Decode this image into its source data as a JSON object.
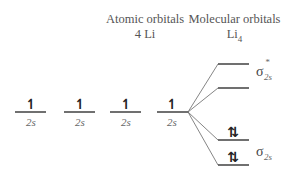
{
  "headers": {
    "atomic": {
      "title": "Atomic orbitals",
      "subtitle": "4 Li"
    },
    "molecular": {
      "title": "Molecular orbitals",
      "subtitle_base": "Li",
      "subtitle_sub": "4"
    }
  },
  "atomic_orbitals": [
    {
      "label": "2s",
      "electrons": "↿"
    },
    {
      "label": "2s",
      "electrons": "↿"
    },
    {
      "label": "2s",
      "electrons": "↿"
    },
    {
      "label": "2s",
      "electrons": "↿"
    }
  ],
  "molecular_orbitals": [
    {
      "name": "sigma-star-2s",
      "label_sym": "σ",
      "label_sup": "*",
      "label_sub": "2s",
      "electrons": ""
    },
    {
      "name": "nonbonding-upper",
      "electrons": ""
    },
    {
      "name": "bonding-upper",
      "electrons": "⇅"
    },
    {
      "name": "sigma-2s",
      "label_sym": "σ",
      "label_sub": "2s",
      "electrons": "⇅"
    }
  ]
}
